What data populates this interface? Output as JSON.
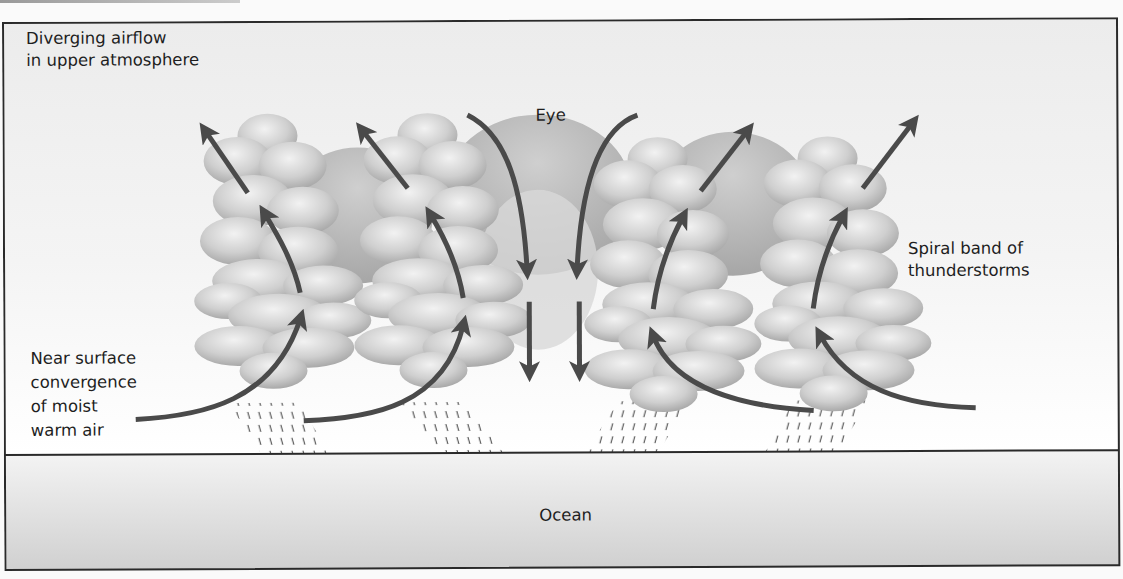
{
  "diagram": {
    "labels": {
      "diverging": [
        "Diverging airflow",
        "in upper atmosphere"
      ],
      "eye": "Eye",
      "spiral": [
        "Spiral band of",
        "thunderstorms"
      ],
      "convergence": [
        "Near surface",
        "convergence",
        "of moist",
        "warm air"
      ],
      "ocean": "Ocean"
    },
    "colors": {
      "arrow": "#4a4a4a",
      "cloud_light": "#e6e6e6",
      "cloud_dark": "#a8a8a8",
      "dome": "#bdbdbd",
      "ocean_top": "#f2f2f2",
      "ocean_bottom": "#d4d4d4",
      "border": "#2a2a2a"
    }
  }
}
